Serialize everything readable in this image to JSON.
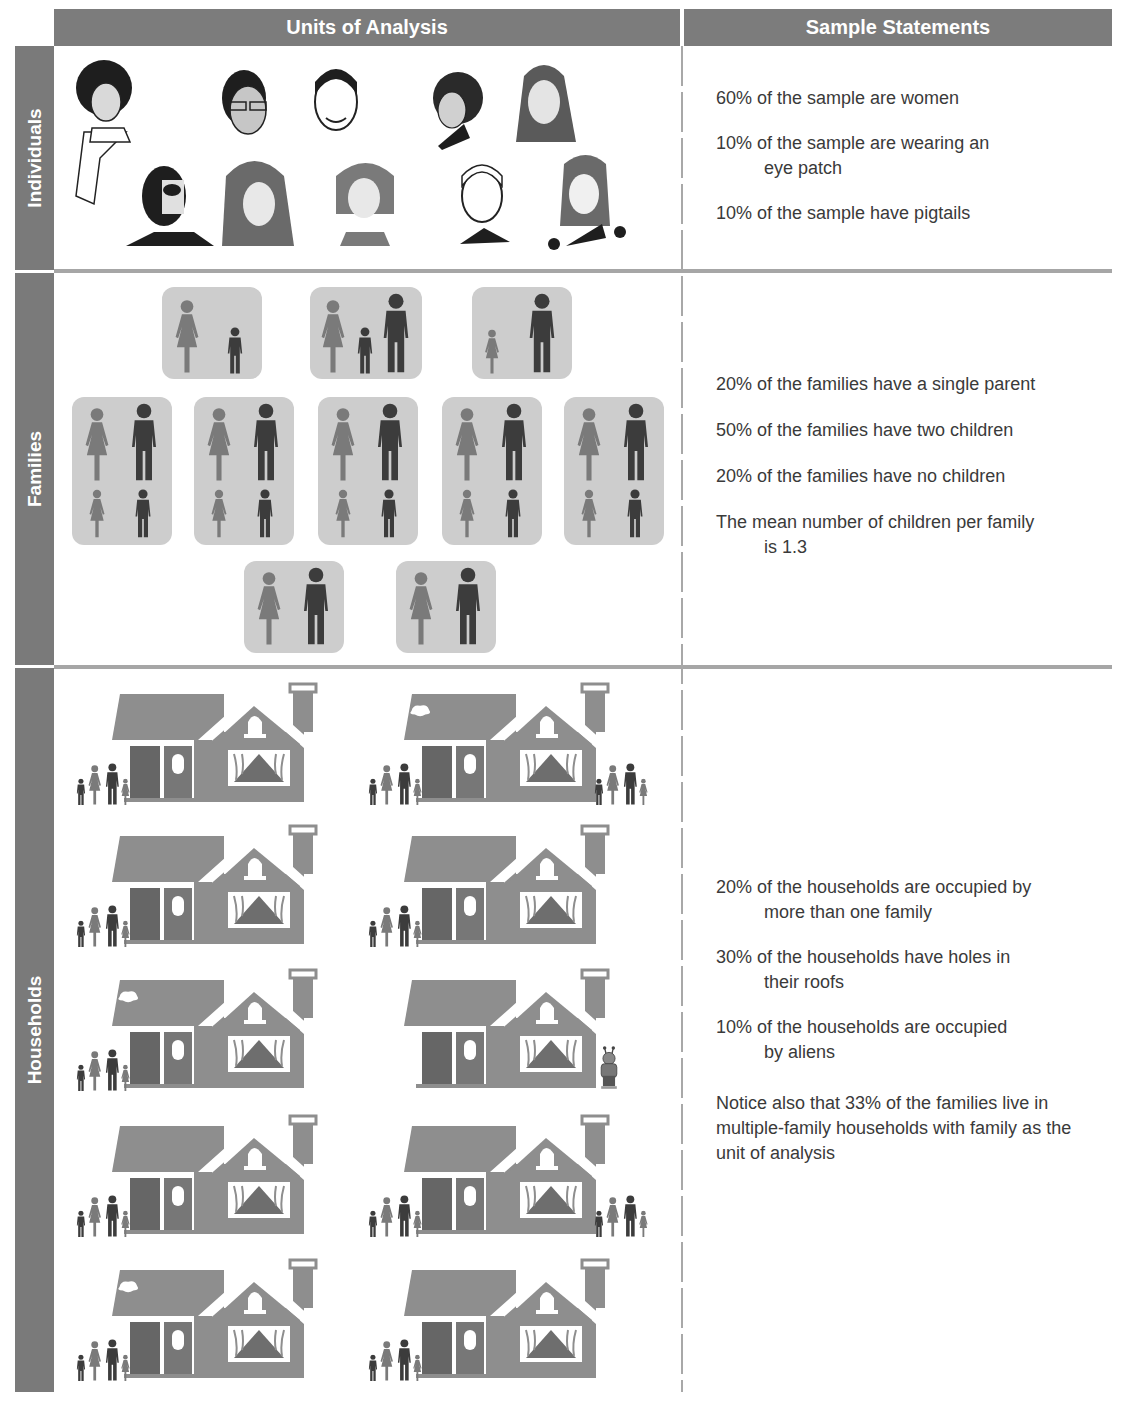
{
  "header": {
    "units_title": "Units of Analysis",
    "statements_title": "Sample Statements"
  },
  "rows": {
    "individuals": {
      "label": "Individuals",
      "statements": [
        {
          "first": "60% of the sample are women",
          "rest": ""
        },
        {
          "first": "10% of the sample are wearing an",
          "rest": "eye patch"
        },
        {
          "first": "10% of the sample have pigtails",
          "rest": ""
        }
      ],
      "portraits": [
        "afro-woman",
        "man-with-glasses",
        "smiling-man",
        "curly-hair-woman",
        "long-hair-woman",
        "eye-patch-bearded-man",
        "wavy-hair-woman",
        "bob-hair-woman",
        "clean-cut-man",
        "pigtails-girl"
      ]
    },
    "families": {
      "label": "Families",
      "statements": [
        {
          "first": "20% of the families have a single parent",
          "rest": ""
        },
        {
          "first": "50% of the families have two children",
          "rest": ""
        },
        {
          "first": "20% of the families have no children",
          "rest": ""
        },
        {
          "first": "The mean number of children per family",
          "rest": "is 1.3"
        }
      ]
    },
    "households": {
      "label": "Households",
      "statements": [
        {
          "first": "20% of the households are occupied by",
          "rest": "more than one family"
        },
        {
          "first": "30% of the households have holes in",
          "rest": "their roofs"
        },
        {
          "first": "10% of the households are occupied",
          "rest": "by aliens"
        },
        {
          "first": "Notice also that 33% of the families live in multiple-family households with family as the unit of analysis",
          "rest": ""
        }
      ]
    }
  },
  "colors": {
    "header_bg": "#7c7c7c",
    "divider": "#a6a6a6",
    "family_box": "#cdcdcd",
    "female_figure": "#7a7a7a",
    "male_figure": "#3c3c3c",
    "house_body": "#8e8e8e"
  }
}
